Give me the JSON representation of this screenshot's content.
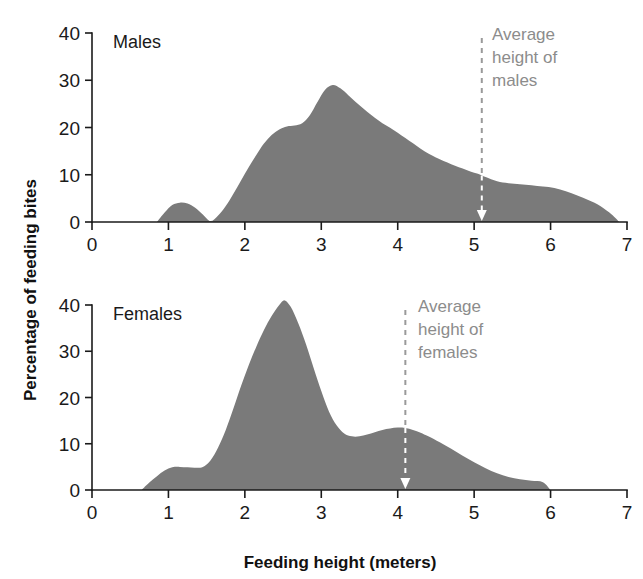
{
  "figure": {
    "y_axis_title": "Percentage of feeding bites",
    "x_axis_title": "Feeding height (meters)",
    "fill_color": "#7a7a7a",
    "axis_color": "#1a1a1a",
    "annotation_color": "#8c8c8c"
  },
  "chart_data": [
    {
      "type": "area",
      "title": "Males",
      "xlabel": "Feeding height (meters)",
      "ylabel": "Percentage of feeding bites",
      "xlim": [
        0,
        7
      ],
      "ylim": [
        0,
        40
      ],
      "xticks": [
        0,
        1,
        2,
        3,
        4,
        5,
        6,
        7
      ],
      "yticks": [
        0,
        10,
        20,
        30,
        40
      ],
      "grid": false,
      "legend": "none",
      "x": [
        0.85,
        0.95,
        1.05,
        1.15,
        1.25,
        1.35,
        1.45,
        1.55,
        1.65,
        1.75,
        1.85,
        1.95,
        2.05,
        2.15,
        2.25,
        2.35,
        2.45,
        2.55,
        2.65,
        2.75,
        2.85,
        2.95,
        3.05,
        3.15,
        3.25,
        3.35,
        3.45,
        3.55,
        3.65,
        3.75,
        3.85,
        3.95,
        4.05,
        4.15,
        4.25,
        4.35,
        4.45,
        4.55,
        4.65,
        4.75,
        4.85,
        4.95,
        5.05,
        5.15,
        5.3,
        5.45,
        5.6,
        5.75,
        5.9,
        6.05,
        6.2,
        6.35,
        6.5,
        6.65,
        6.8,
        6.9
      ],
      "y": [
        0.0,
        2.0,
        3.6,
        4.1,
        3.9,
        3.0,
        1.6,
        0.2,
        1.4,
        3.4,
        6.0,
        8.8,
        11.6,
        14.2,
        16.6,
        18.4,
        19.6,
        20.2,
        20.4,
        20.9,
        22.6,
        25.4,
        28.0,
        29.0,
        28.3,
        26.9,
        25.4,
        24.0,
        22.7,
        21.5,
        20.4,
        19.4,
        18.3,
        17.2,
        16.1,
        15.0,
        14.1,
        13.3,
        12.6,
        11.9,
        11.3,
        10.7,
        10.2,
        9.5,
        8.6,
        8.2,
        8.0,
        7.8,
        7.5,
        7.2,
        6.5,
        5.6,
        4.6,
        3.4,
        1.6,
        0.0
      ],
      "annotation": {
        "text_lines": [
          "Average",
          "height of",
          "males"
        ],
        "x_value": 5.1,
        "style": "dashed-arrow-down"
      }
    },
    {
      "type": "area",
      "title": "Females",
      "xlabel": "Feeding height (meters)",
      "ylabel": "Percentage of feeding bites",
      "xlim": [
        0,
        7
      ],
      "ylim": [
        0,
        40
      ],
      "xticks": [
        0,
        1,
        2,
        3,
        4,
        5,
        6,
        7
      ],
      "yticks": [
        0,
        10,
        20,
        30,
        40
      ],
      "grid": false,
      "legend": "none",
      "x": [
        0.65,
        0.75,
        0.85,
        0.95,
        1.05,
        1.15,
        1.25,
        1.35,
        1.45,
        1.55,
        1.65,
        1.75,
        1.85,
        1.95,
        2.05,
        2.15,
        2.25,
        2.35,
        2.45,
        2.52,
        2.6,
        2.7,
        2.8,
        2.9,
        3.0,
        3.1,
        3.2,
        3.3,
        3.4,
        3.5,
        3.6,
        3.7,
        3.8,
        3.9,
        4.0,
        4.1,
        4.2,
        4.3,
        4.4,
        4.55,
        4.7,
        4.85,
        5.0,
        5.15,
        5.3,
        5.45,
        5.6,
        5.75,
        5.9,
        6.0
      ],
      "y": [
        0.0,
        1.6,
        3.0,
        4.2,
        4.9,
        5.0,
        4.9,
        4.8,
        5.0,
        6.4,
        9.2,
        13.0,
        17.6,
        22.5,
        27.0,
        31.0,
        34.6,
        37.6,
        40.0,
        41.0,
        39.6,
        36.0,
        31.5,
        26.4,
        21.4,
        17.0,
        14.0,
        12.2,
        11.6,
        11.6,
        12.0,
        12.5,
        13.0,
        13.3,
        13.5,
        13.4,
        13.0,
        12.4,
        11.6,
        10.3,
        8.9,
        7.4,
        6.0,
        4.7,
        3.6,
        2.8,
        2.3,
        2.0,
        1.7,
        0.0
      ],
      "annotation": {
        "text_lines": [
          "Average",
          "height of",
          "females"
        ],
        "x_value": 4.1,
        "style": "dashed-arrow-down"
      }
    }
  ]
}
